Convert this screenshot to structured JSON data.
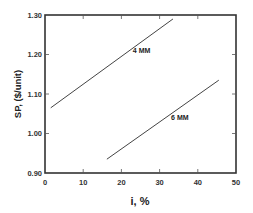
{
  "chart_data": {
    "type": "line",
    "title": "",
    "xlabel": "i, %",
    "ylabel": "SP, ($/unit)",
    "xlim": [
      0,
      50
    ],
    "ylim": [
      0.9,
      1.3
    ],
    "x_ticks": [
      "0",
      "10",
      "20",
      "30",
      "40",
      "50"
    ],
    "y_ticks": [
      "0.90",
      "1.00",
      "1.10",
      "1.20",
      "1.30"
    ],
    "grid": false,
    "legend": "inline labels",
    "series": [
      {
        "name": "4 MM",
        "x": [
          1.5,
          33.5
        ],
        "y": [
          1.065,
          1.29
        ],
        "label_pos": [
          23.0,
          1.205
        ]
      },
      {
        "name": "6 MM",
        "x": [
          16.2,
          45.5
        ],
        "y": [
          0.935,
          1.135
        ],
        "label_pos": [
          33.0,
          1.035
        ]
      }
    ]
  }
}
